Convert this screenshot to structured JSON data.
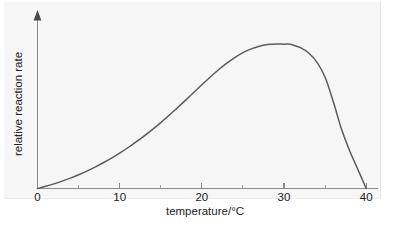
{
  "chart_data": {
    "type": "line",
    "title": "",
    "xlabel": "temperature/°C",
    "ylabel": "relative reaction rate",
    "xlim": [
      0,
      41.5
    ],
    "ylim": [
      0,
      1.12
    ],
    "grid": false,
    "legend": "none",
    "x_ticks_major": [
      0,
      10,
      20,
      30,
      40
    ],
    "x_tick_labels": [
      "0",
      "10",
      "20",
      "30",
      "40"
    ],
    "x_ticks_minor": [
      5,
      15,
      25,
      35
    ],
    "y_ticks": [],
    "y_tick_labels": [],
    "y_axis_arrow": true,
    "peak": {
      "x": 30.5,
      "y": 1.0
    },
    "zero_crossing": {
      "x": 40.0,
      "y": 0.0
    },
    "series": [
      {
        "name": "relative reaction rate",
        "color": "#5c5c5c",
        "x": [
          0,
          1,
          2,
          3,
          4,
          5,
          6,
          7,
          8,
          9,
          10,
          11,
          12,
          13,
          14,
          15,
          16,
          17,
          18,
          19,
          20,
          21,
          22,
          23,
          24,
          25,
          26,
          27,
          28,
          29,
          30,
          30.5,
          31,
          32,
          33,
          34,
          35,
          36,
          37,
          38,
          39,
          40
        ],
        "y": [
          0.0,
          0.015,
          0.032,
          0.051,
          0.072,
          0.095,
          0.12,
          0.148,
          0.178,
          0.21,
          0.245,
          0.282,
          0.322,
          0.364,
          0.409,
          0.456,
          0.506,
          0.557,
          0.61,
          0.664,
          0.718,
          0.77,
          0.82,
          0.866,
          0.906,
          0.94,
          0.966,
          0.985,
          0.996,
          1.0,
          0.999,
          1.0,
          0.995,
          0.975,
          0.938,
          0.875,
          0.77,
          0.6,
          0.41,
          0.26,
          0.13,
          0.0
        ]
      }
    ],
    "colors": {
      "curve": "#5c5c5c",
      "axis": "#8b8b8b",
      "text": "#222222",
      "panel_background": "#f6f6f6",
      "page_background": "#ffffff"
    }
  },
  "axes": {
    "x_label": "temperature/°C",
    "y_label": "relative reaction rate",
    "x_tick_0": "0",
    "x_tick_10": "10",
    "x_tick_20": "20",
    "x_tick_30": "30",
    "x_tick_40": "40"
  }
}
